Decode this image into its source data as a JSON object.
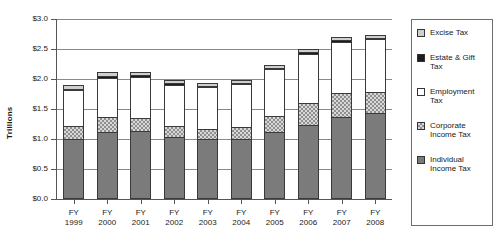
{
  "chart_data": {
    "type": "bar",
    "stacked": true,
    "title": "",
    "xlabel": "",
    "ylabel": "Trillions",
    "ylim": [
      0.0,
      3.0
    ],
    "ytick_step": 0.5,
    "ytick_labels": [
      "$3.0",
      "$2.5",
      "$2.0",
      "$1.5",
      "$1.0",
      "$0.5",
      "$0.0"
    ],
    "ytick_values": [
      3.0,
      2.5,
      2.0,
      1.5,
      1.0,
      0.5,
      0.0
    ],
    "grid": true,
    "legend_position": "right",
    "categories": [
      "FY 1999",
      "FY 2000",
      "FY 2001",
      "FY 2002",
      "FY 2003",
      "FY 2004",
      "FY 2005",
      "FY 2006",
      "FY 2007",
      "FY 2008"
    ],
    "category_lines": [
      [
        "FY",
        "1999"
      ],
      [
        "FY",
        "2000"
      ],
      [
        "FY",
        "2001"
      ],
      [
        "FY",
        "2002"
      ],
      [
        "FY",
        "2003"
      ],
      [
        "FY",
        "2004"
      ],
      [
        "FY",
        "2005"
      ],
      [
        "FY",
        "2006"
      ],
      [
        "FY",
        "2007"
      ],
      [
        "FY",
        "2008"
      ]
    ],
    "series": [
      {
        "name": "Individual Income Tax",
        "key": "individual",
        "color": "#7b7b7b",
        "pattern": "solid-gray",
        "values": [
          1.0,
          1.12,
          1.13,
          1.04,
          1.0,
          1.0,
          1.11,
          1.24,
          1.37,
          1.43
        ]
      },
      {
        "name": "Corporate Income Tax",
        "key": "corporate",
        "color": "#d8d8d8",
        "pattern": "checker",
        "values": [
          0.22,
          0.25,
          0.22,
          0.17,
          0.17,
          0.2,
          0.28,
          0.36,
          0.4,
          0.35
        ]
      },
      {
        "name": "Employment Tax",
        "key": "employment",
        "color": "#ffffff",
        "pattern": "white",
        "values": [
          0.59,
          0.65,
          0.68,
          0.69,
          0.7,
          0.72,
          0.77,
          0.82,
          0.85,
          0.88
        ]
      },
      {
        "name": "Estate & Gift Tax",
        "key": "estategift",
        "color": "#1c1c1c",
        "pattern": "solid-black",
        "values": [
          0.03,
          0.03,
          0.03,
          0.03,
          0.02,
          0.02,
          0.03,
          0.03,
          0.03,
          0.03
        ]
      },
      {
        "name": "Excise Tax",
        "key": "excise",
        "color": "#cfcfcf",
        "pattern": "light-gray",
        "values": [
          0.06,
          0.06,
          0.05,
          0.05,
          0.05,
          0.05,
          0.05,
          0.05,
          0.05,
          0.05
        ]
      }
    ],
    "totals": [
      1.9,
      2.11,
      2.11,
      1.98,
      1.94,
      1.99,
      2.24,
      2.5,
      2.7,
      2.74
    ],
    "legend": [
      {
        "label": "Excise Tax",
        "key": "excise"
      },
      {
        "label": "Estate & Gift Tax",
        "key": "estategift"
      },
      {
        "label": "Employment Tax",
        "key": "employment"
      },
      {
        "label": "Corporate Income Tax",
        "key": "corporate"
      },
      {
        "label": "Individual Income Tax",
        "key": "individual"
      }
    ]
  }
}
